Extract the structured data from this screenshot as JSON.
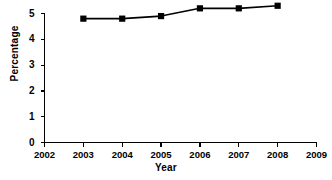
{
  "chart_data": {
    "type": "line",
    "title": "",
    "xlabel": "Year",
    "ylabel": "Percentage",
    "x": [
      2003,
      2004,
      2005,
      2006,
      2007,
      2008
    ],
    "values": [
      4.8,
      4.8,
      4.9,
      5.2,
      5.2,
      5.3
    ],
    "series": [
      {
        "name": "Percentage",
        "values": [
          4.8,
          4.8,
          4.9,
          5.2,
          5.2,
          5.3
        ],
        "marker": "square",
        "marker_color": "#000000",
        "line_color": "#000000"
      }
    ],
    "xlim": [
      2002,
      2009
    ],
    "ylim": [
      0,
      5
    ],
    "xticks": [
      2002,
      2003,
      2004,
      2005,
      2006,
      2007,
      2008,
      2009
    ],
    "xtick_labels": [
      "2002",
      "2003",
      "2004",
      "2005",
      "2006",
      "2007",
      "2008",
      "2009"
    ],
    "yticks": [
      0,
      1,
      2,
      3,
      4,
      5
    ],
    "ytick_labels": [
      "0",
      "1",
      "2",
      "3",
      "4",
      "5"
    ],
    "grid": false,
    "legend": false,
    "background": "#ffffff",
    "axis_color": "#000000"
  }
}
